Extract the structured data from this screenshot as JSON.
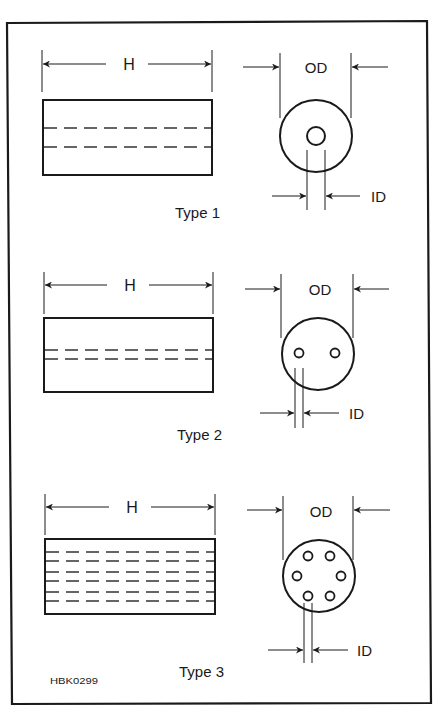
{
  "figure": {
    "code": "HBK0299",
    "colors": {
      "line": "#1a1a1a",
      "dash": "#333333",
      "background": "#ffffff"
    },
    "dimension_labels": {
      "length": "H",
      "outer": "OD",
      "inner": "ID"
    },
    "types": [
      {
        "label": "Type 1",
        "holes": 1,
        "side_dash_rows": 2
      },
      {
        "label": "Type 2",
        "holes": 2,
        "side_dash_rows": 2
      },
      {
        "label": "Type 3",
        "holes": 6,
        "side_dash_rows": 6
      }
    ]
  }
}
